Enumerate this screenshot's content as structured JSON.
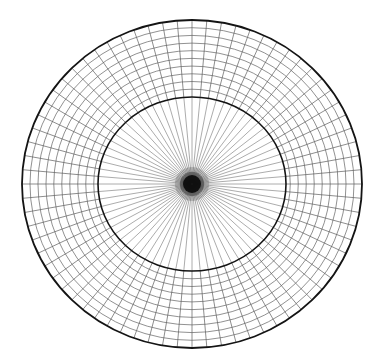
{
  "figure": {
    "background_color": "#ffffff",
    "width": 382,
    "height": 364
  },
  "chart_data": {
    "type": "polar-grid",
    "title": "",
    "subtitle": "",
    "xlabel": "",
    "ylabel": "",
    "grid": true,
    "legend": null,
    "annotations": [],
    "projection": "polar",
    "center": {
      "x": 192,
      "y": 184
    },
    "colors": {
      "background": "#ffffff",
      "boundary_stroke": "#141414",
      "grid_stroke": "#5f5f5f",
      "spoke_stroke": "#5a5a5a",
      "core_fill": "#0d0d0d"
    },
    "radial_axis": {
      "label": "",
      "range": [
        0,
        1
      ],
      "inner_boundary_fraction": 0.53,
      "outer_boundary_fraction": 1.0,
      "ring_count_outer_annulus": 10,
      "rings_in_inner_disc": 0,
      "ring_fractions": [
        0.53,
        0.578,
        0.625,
        0.672,
        0.719,
        0.766,
        0.813,
        0.859,
        0.906,
        0.953,
        1.0
      ]
    },
    "angular_axis": {
      "label": "",
      "range_degrees": [
        0,
        360
      ],
      "spoke_count": 72,
      "spoke_spacing_degrees": 5,
      "tick_labels": []
    },
    "geometry": {
      "outer_ellipse": {
        "cx": 192,
        "cy": 184,
        "rx": 170,
        "ry": 164
      },
      "inner_ellipse": {
        "cx": 192,
        "cy": 184,
        "rx": 94,
        "ry": 87
      },
      "core_blob": {
        "cx": 192,
        "cy": 184,
        "rx": 9,
        "ry": 9
      }
    },
    "stroke_widths": {
      "outer_boundary": 1.8,
      "inner_boundary": 1.6,
      "ring": 0.75,
      "spoke_outer": 0.75,
      "spoke_inner": 0.65
    },
    "series": [
      {
        "name": "radial-spokes",
        "kind": "lines",
        "count": 72,
        "values": [
          0,
          5,
          10,
          15,
          20,
          25,
          30,
          35,
          40,
          45,
          50,
          55,
          60,
          65,
          70,
          75,
          80,
          85,
          90,
          95,
          100,
          105,
          110,
          115,
          120,
          125,
          130,
          135,
          140,
          145,
          150,
          155,
          160,
          165,
          170,
          175,
          180,
          185,
          190,
          195,
          200,
          205,
          210,
          215,
          220,
          225,
          230,
          235,
          240,
          245,
          250,
          255,
          260,
          265,
          270,
          275,
          280,
          285,
          290,
          295,
          300,
          305,
          310,
          315,
          320,
          325,
          330,
          335,
          340,
          345,
          350,
          355
        ]
      },
      {
        "name": "concentric-rings",
        "kind": "ellipses",
        "count": 11,
        "values": [
          0.53,
          0.578,
          0.625,
          0.672,
          0.719,
          0.766,
          0.813,
          0.859,
          0.906,
          0.953,
          1.0
        ]
      }
    ]
  }
}
